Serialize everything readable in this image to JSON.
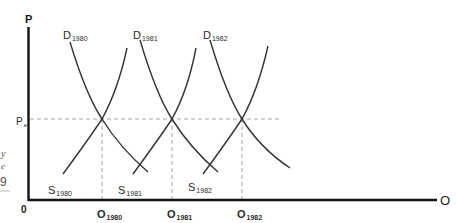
{
  "diagram": {
    "type": "supply-demand-shifts",
    "axes": {
      "y_label": "P",
      "x_label": "O",
      "origin_label": "0",
      "price_level_label": "P",
      "price_level_sub": "e"
    },
    "demand_curves": [
      {
        "label": "D",
        "year": "1980"
      },
      {
        "label": "D",
        "year": "1981"
      },
      {
        "label": "D",
        "year": "1982"
      }
    ],
    "supply_curves": [
      {
        "label": "S",
        "year": "1980"
      },
      {
        "label": "S",
        "year": "1981"
      },
      {
        "label": "S",
        "year": "1982"
      }
    ],
    "quantity_labels": [
      {
        "label": "O",
        "year": "1980"
      },
      {
        "label": "O",
        "year": "1981"
      },
      {
        "label": "O",
        "year": "1982"
      }
    ],
    "left_margin_fragments": [
      "y",
      "e",
      "9"
    ],
    "colors": {
      "curve": "#333333",
      "axis": "#111111",
      "dashed": "#999999"
    }
  }
}
